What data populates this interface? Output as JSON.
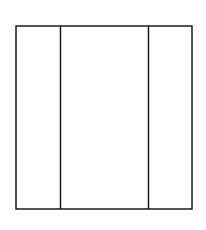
{
  "diagram": {
    "type": "three-panel-rectangle",
    "canvas": {
      "width": 206,
      "height": 230,
      "background": "#ffffff"
    },
    "stroke_color": "#1a1a1a",
    "stroke_width": 1.5,
    "outer_frame": {
      "x": 16,
      "y": 26,
      "width": 176,
      "height": 183
    },
    "dividers": [
      {
        "x": 60.5
      },
      {
        "x": 148.5
      }
    ],
    "panels": [
      {
        "name": "left-panel",
        "x": 16,
        "width": 44.5
      },
      {
        "name": "center-panel",
        "x": 60.5,
        "width": 88
      },
      {
        "name": "right-panel",
        "x": 148.5,
        "width": 43.5
      }
    ]
  }
}
